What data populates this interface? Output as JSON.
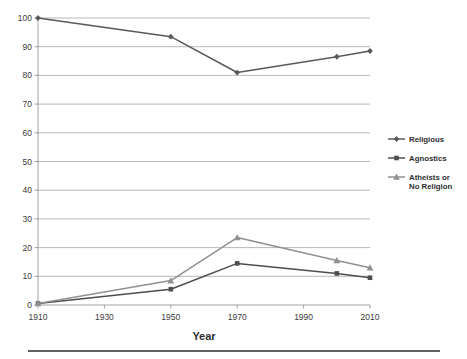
{
  "chart_data": {
    "type": "line",
    "title": "",
    "subtitle": "",
    "xlabel": "Year",
    "ylabel": "",
    "x": [
      1910,
      1950,
      1970,
      2000,
      2010
    ],
    "xlim": [
      1910,
      2010
    ],
    "ylim": [
      0,
      100
    ],
    "xticks": [
      1910,
      1930,
      1950,
      1970,
      1990,
      2010
    ],
    "xtick_labels": [
      "1910",
      "1930",
      "1950",
      "1970",
      "1990",
      "2010"
    ],
    "yticks": [
      0,
      10,
      20,
      30,
      40,
      50,
      60,
      70,
      80,
      90,
      100
    ],
    "ytick_labels": [
      "0",
      "10",
      "20",
      "30",
      "40",
      "50",
      "60",
      "70",
      "80",
      "90",
      "100"
    ],
    "grid": "horizontal",
    "legend_position": "right",
    "series": [
      {
        "name": "Religious",
        "marker": "diamond",
        "color": "#595959",
        "values": [
          100,
          93.5,
          81,
          86.5,
          88.5
        ]
      },
      {
        "name": "Agnostics",
        "marker": "square",
        "color": "#4d4d4d",
        "values": [
          0.5,
          5.5,
          14.5,
          11,
          9.5
        ]
      },
      {
        "name": "Atheists or No Religion",
        "marker": "triangle",
        "color": "#909090",
        "values": [
          0.5,
          8.5,
          23.5,
          15.5,
          13
        ]
      }
    ]
  },
  "legend": {
    "entries": [
      {
        "label": "Religious"
      },
      {
        "label": "Agnostics"
      },
      {
        "label_line1": "Atheists or",
        "label_line2": "No Religion"
      }
    ]
  },
  "axis_titles": {
    "x": "Year"
  },
  "colors": {
    "religious": "#595959",
    "agnostics": "#4d4d4d",
    "atheists": "#909090",
    "grid": "#9a9a9a",
    "axis": "#8c8c8c",
    "text": "#2e2e2e",
    "rule": "#2b2b2b",
    "background": "#ffffff"
  }
}
